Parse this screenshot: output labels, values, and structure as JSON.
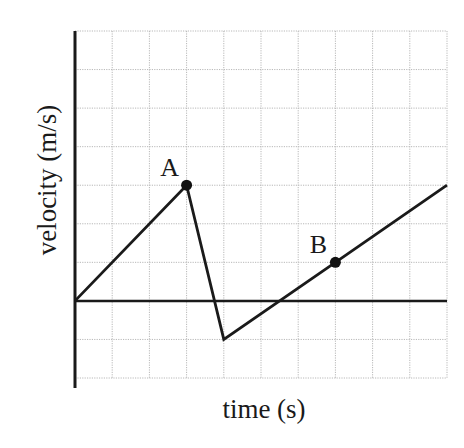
{
  "chart_data": {
    "type": "line",
    "title": "",
    "xlabel": "time (s)",
    "ylabel": "velocity (m/s)",
    "x": [
      0,
      3,
      4,
      7,
      10
    ],
    "series": [
      {
        "name": "velocity",
        "values": [
          0,
          3,
          -1,
          1,
          3
        ]
      }
    ],
    "annotations": [
      {
        "label": "A",
        "x": 3,
        "y": 3
      },
      {
        "label": "B",
        "x": 7,
        "y": 1
      }
    ],
    "xlim": [
      0,
      10
    ],
    "ylim": [
      -2,
      7
    ],
    "grid": true,
    "tick_labels": false,
    "legend": "none"
  },
  "labels": {
    "xlabel": "time (s)",
    "ylabel": "velocity (m/s)",
    "point_a": "A",
    "point_b": "B"
  },
  "colors": {
    "line": "#1a1a1a",
    "grid": "#b8b8b8",
    "background": "#ffffff"
  }
}
